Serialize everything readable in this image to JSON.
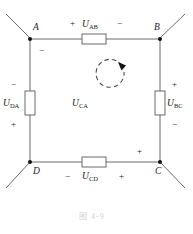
{
  "figure": {
    "caption": "图   4-9",
    "nodes": [
      {
        "id": "A",
        "label": "A",
        "x": 30,
        "y": 38
      },
      {
        "id": "B",
        "label": "B",
        "x": 160,
        "y": 38
      },
      {
        "id": "C",
        "label": "C",
        "x": 160,
        "y": 162
      },
      {
        "id": "D",
        "label": "D",
        "x": 30,
        "y": 162
      }
    ],
    "elements": [
      {
        "id": "R_AB",
        "label": "U",
        "subscript": "AB",
        "orientation": "horizontal"
      },
      {
        "id": "R_BC",
        "label": "U",
        "subscript": "BC",
        "orientation": "vertical"
      },
      {
        "id": "R_CD",
        "label": "U",
        "subscript": "CD",
        "orientation": "horizontal"
      },
      {
        "id": "R_DA",
        "label": "U",
        "subscript": "DA",
        "orientation": "vertical"
      }
    ],
    "center_label": {
      "label": "U",
      "subscript": "CA"
    },
    "loop_arrow": {
      "direction": "clockwise",
      "style": "dashed"
    },
    "polarity_marks": [
      {
        "id": "ab-plus",
        "sign": "+",
        "branch": "AB",
        "near": "A"
      },
      {
        "id": "ab-minus",
        "sign": "−",
        "branch": "AB",
        "near": "B"
      },
      {
        "id": "da-top",
        "sign": "−",
        "branch": "DA",
        "near": "A"
      },
      {
        "id": "da-mid-minus",
        "sign": "−",
        "branch": "DA",
        "near": "top"
      },
      {
        "id": "da-mid-plus",
        "sign": "+",
        "branch": "DA",
        "near": "bottom"
      },
      {
        "id": "bc-plus",
        "sign": "+",
        "branch": "BC",
        "near": "B"
      },
      {
        "id": "bc-minus",
        "sign": "−",
        "branch": "BC",
        "near": "C"
      },
      {
        "id": "cd-minus",
        "sign": "−",
        "branch": "CD",
        "near": "D"
      },
      {
        "id": "cd-plus",
        "sign": "+",
        "branch": "CD",
        "near": "C"
      },
      {
        "id": "c-top-plus",
        "sign": "+",
        "branch": "BC",
        "near": "C-corner"
      }
    ],
    "colors": {
      "wire": "#4a4a4a",
      "node": "#111111",
      "text": "#1a1a1a",
      "caption": "#d2d2d2",
      "background": "#ffffff"
    }
  }
}
